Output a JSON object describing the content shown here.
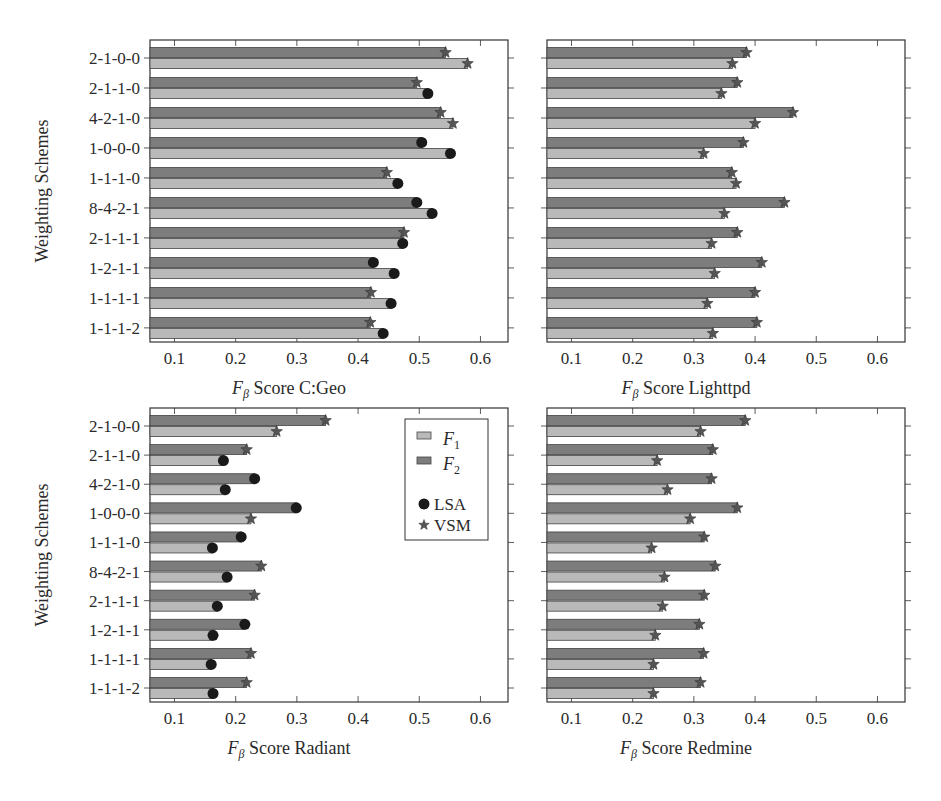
{
  "chart_data": [
    {
      "type": "bar",
      "orientation": "horizontal",
      "title": "",
      "xlabel": "F_β Score C:Geo",
      "xlabel_main": "F",
      "xlabel_sub": "β",
      "xlabel_rest": " Score C:Geo",
      "ylabel": "Weighting Schemes",
      "xlim": [
        0.06,
        0.645
      ],
      "xticks": [
        0.1,
        0.2,
        0.3,
        0.4,
        0.5,
        0.6
      ],
      "categories": [
        "2-1-0-0",
        "2-1-1-0",
        "4-2-1-0",
        "1-0-0-0",
        "1-1-1-0",
        "8-4-2-1",
        "2-1-1-1",
        "1-2-1-1",
        "1-1-1-1",
        "1-1-1-2"
      ],
      "series": [
        {
          "name": "F2",
          "values": [
            0.543,
            0.496,
            0.535,
            0.504,
            0.447,
            0.496,
            0.475,
            0.425,
            0.421,
            0.42
          ],
          "markers": [
            "VSM",
            "VSM",
            "VSM",
            "LSA",
            "VSM",
            "LSA",
            "VSM",
            "LSA",
            "VSM",
            "VSM"
          ]
        },
        {
          "name": "F1",
          "values": [
            0.579,
            0.514,
            0.555,
            0.551,
            0.465,
            0.521,
            0.473,
            0.459,
            0.454,
            0.441
          ],
          "markers": [
            "VSM",
            "LSA",
            "VSM",
            "LSA",
            "LSA",
            "LSA",
            "LSA",
            "LSA",
            "LSA",
            "LSA"
          ]
        }
      ],
      "legend": false
    },
    {
      "type": "bar",
      "orientation": "horizontal",
      "title": "",
      "xlabel": "F_β Score Lighttpd",
      "xlabel_main": "F",
      "xlabel_sub": "β",
      "xlabel_rest": " Score Lighttpd",
      "ylabel": "",
      "xlim": [
        0.06,
        0.645
      ],
      "xticks": [
        0.1,
        0.2,
        0.3,
        0.4,
        0.5,
        0.6
      ],
      "categories": [
        "2-1-0-0",
        "2-1-1-0",
        "4-2-1-0",
        "1-0-0-0",
        "1-1-1-0",
        "8-4-2-1",
        "2-1-1-1",
        "1-2-1-1",
        "1-1-1-1",
        "1-1-1-2"
      ],
      "series": [
        {
          "name": "F2",
          "values": [
            0.386,
            0.371,
            0.462,
            0.381,
            0.362,
            0.448,
            0.371,
            0.411,
            0.4,
            0.403
          ],
          "markers": [
            "VSM",
            "VSM",
            "VSM",
            "VSM",
            "VSM",
            "VSM",
            "VSM",
            "VSM",
            "VSM",
            "VSM"
          ]
        },
        {
          "name": "F1",
          "values": [
            0.363,
            0.345,
            0.4,
            0.316,
            0.369,
            0.35,
            0.329,
            0.334,
            0.322,
            0.331
          ],
          "markers": [
            "VSM",
            "VSM",
            "VSM",
            "VSM",
            "VSM",
            "VSM",
            "VSM",
            "VSM",
            "VSM",
            "VSM"
          ]
        }
      ],
      "legend": false
    },
    {
      "type": "bar",
      "orientation": "horizontal",
      "title": "",
      "xlabel": "F_β Score Radiant",
      "xlabel_main": "F",
      "xlabel_sub": "β",
      "xlabel_rest": " Score Radiant",
      "ylabel": "Weighting Schemes",
      "xlim": [
        0.06,
        0.645
      ],
      "xticks": [
        0.1,
        0.2,
        0.3,
        0.4,
        0.5,
        0.6
      ],
      "categories": [
        "2-1-0-0",
        "2-1-1-0",
        "4-2-1-0",
        "1-0-0-0",
        "1-1-1-0",
        "8-4-2-1",
        "2-1-1-1",
        "1-2-1-1",
        "1-1-1-1",
        "1-1-1-2"
      ],
      "series": [
        {
          "name": "F2",
          "values": [
            0.347,
            0.218,
            0.231,
            0.299,
            0.209,
            0.242,
            0.231,
            0.215,
            0.225,
            0.218
          ],
          "markers": [
            "VSM",
            "VSM",
            "LSA",
            "LSA",
            "LSA",
            "VSM",
            "VSM",
            "LSA",
            "VSM",
            "VSM"
          ]
        },
        {
          "name": "F1",
          "values": [
            0.267,
            0.18,
            0.183,
            0.225,
            0.162,
            0.186,
            0.17,
            0.163,
            0.16,
            0.163
          ],
          "markers": [
            "VSM",
            "LSA",
            "LSA",
            "VSM",
            "LSA",
            "LSA",
            "LSA",
            "LSA",
            "LSA",
            "LSA"
          ]
        }
      ],
      "legend": true,
      "legend_position": "upper right",
      "legend_entries": [
        {
          "label_main": "F",
          "label_sub": "1",
          "kind": "bar",
          "series": "F1"
        },
        {
          "label_main": "F",
          "label_sub": "2",
          "kind": "bar",
          "series": "F2"
        },
        {
          "label": "LSA",
          "kind": "marker",
          "marker": "circle"
        },
        {
          "label": "VSM",
          "kind": "marker",
          "marker": "star"
        }
      ]
    },
    {
      "type": "bar",
      "orientation": "horizontal",
      "title": "",
      "xlabel": "F_β Score Redmine",
      "xlabel_main": "F",
      "xlabel_sub": "β",
      "xlabel_rest": " Score Redmine",
      "ylabel": "",
      "xlim": [
        0.06,
        0.645
      ],
      "xticks": [
        0.1,
        0.2,
        0.3,
        0.4,
        0.5,
        0.6
      ],
      "categories": [
        "2-1-0-0",
        "2-1-1-0",
        "4-2-1-0",
        "1-0-0-0",
        "1-1-1-0",
        "8-4-2-1",
        "2-1-1-1",
        "1-2-1-1",
        "1-1-1-1",
        "1-1-1-2"
      ],
      "series": [
        {
          "name": "F2",
          "values": [
            0.384,
            0.331,
            0.329,
            0.371,
            0.317,
            0.335,
            0.317,
            0.309,
            0.316,
            0.311
          ],
          "markers": [
            "VSM",
            "VSM",
            "VSM",
            "VSM",
            "VSM",
            "VSM",
            "VSM",
            "VSM",
            "VSM",
            "VSM"
          ]
        },
        {
          "name": "F1",
          "values": [
            0.311,
            0.24,
            0.257,
            0.294,
            0.231,
            0.252,
            0.249,
            0.237,
            0.234,
            0.234
          ],
          "markers": [
            "VSM",
            "VSM",
            "VSM",
            "VSM",
            "VSM",
            "VSM",
            "VSM",
            "VSM",
            "VSM",
            "VSM"
          ]
        }
      ],
      "legend": false
    }
  ],
  "colors": {
    "F1": "#b9b9b9",
    "F2": "#7d7d7d",
    "bar_edge": "#444444",
    "axis": "#333333",
    "marker": "#1a1a1a"
  },
  "layout": {
    "panels": [
      {
        "left": 150,
        "top": 40,
        "width": 358,
        "height": 302,
        "show_ylabels": true
      },
      {
        "left": 547,
        "top": 40,
        "width": 358,
        "height": 302,
        "show_ylabels": false
      },
      {
        "left": 150,
        "top": 408,
        "width": 358,
        "height": 294,
        "show_ylabels": true
      },
      {
        "left": 547,
        "top": 408,
        "width": 358,
        "height": 294,
        "show_ylabels": false
      }
    ]
  }
}
